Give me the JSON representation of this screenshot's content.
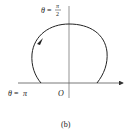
{
  "figure": {
    "caption": "(b)",
    "origin_label": "O",
    "top_label": {
      "theta": "θ",
      "eq": "=",
      "num": "π",
      "den": "2"
    },
    "left_label": {
      "theta": "θ",
      "eq": "=",
      "val": "π"
    },
    "colors": {
      "stroke": "#222222",
      "axis": "#555555",
      "background": "#ffffff"
    },
    "curve": {
      "type": "polar curve (cardioid-like loop above axis)",
      "direction": "counter-clockwise"
    }
  }
}
